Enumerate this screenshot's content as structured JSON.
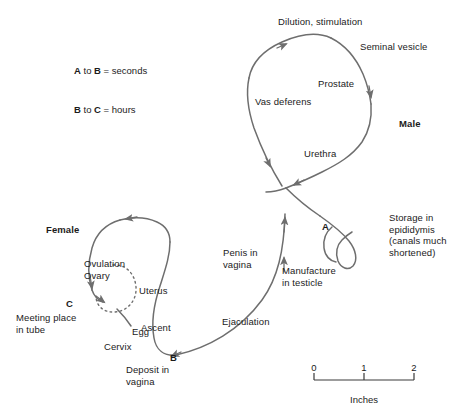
{
  "figure": {
    "background_color": "#ffffff",
    "stroke_color": "#6e6e6e",
    "text_color": "#1b1b1b"
  },
  "legend": {
    "line1_a": "A",
    "line1_mid": " to ",
    "line1_b": "B",
    "line1_rest": " = seconds",
    "line2_b": "B",
    "line2_mid": " to ",
    "line2_c": "C",
    "line2_rest": " = hours"
  },
  "section_titles": {
    "male": "Male",
    "female": "Female"
  },
  "points": {
    "a": "A",
    "b": "B",
    "c": "C"
  },
  "labels": {
    "dilution": "Dilution, stimulation",
    "seminal_vesicle": "Seminal vesicle",
    "prostate": "Prostate",
    "vas_deferens": "Vas deferens",
    "urethra": "Urethra",
    "storage": "Storage in\nepididymis\n(canals much\nshortened)",
    "manufacture": "Manufacture\nin testicle",
    "penis_in_vagina": "Penis in\nvagina",
    "ejaculation": "Ejaculation",
    "deposit": "Deposit in\nvagina",
    "ascent": "Ascent",
    "cervix": "Cervix",
    "uterus": "Uterus",
    "ovulation": "Ovulation",
    "ovary": "Ovary",
    "egg": "Egg",
    "meeting_place": "Meeting place\nin tube"
  },
  "scale_bar": {
    "ticks": [
      "0",
      "1",
      "2"
    ],
    "caption": "Inches"
  }
}
